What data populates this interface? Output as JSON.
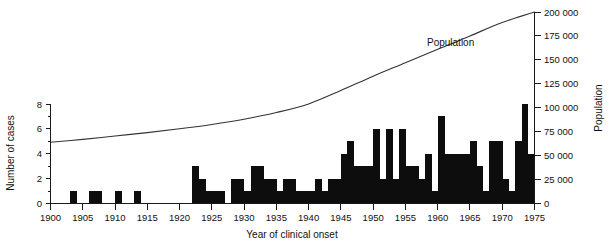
{
  "chart_data": {
    "type": "bar",
    "title": "",
    "xlabel": "Year of clinical onset",
    "ylabel": "Number of cases",
    "y2label": "Population",
    "xlim": [
      1900,
      1975
    ],
    "ylim": [
      0,
      8
    ],
    "y2lim": [
      0,
      200000
    ],
    "grid": false,
    "legend_position": "inline-annotation",
    "x_tick_labels": [
      "1900",
      "1905",
      "1910",
      "1915",
      "1920",
      "1925",
      "1930",
      "1935",
      "1940",
      "1945",
      "1950",
      "1955",
      "1960",
      "1965",
      "1970",
      "1975"
    ],
    "x_tick_values": [
      1900,
      1905,
      1910,
      1915,
      1920,
      1925,
      1930,
      1935,
      1940,
      1945,
      1950,
      1955,
      1960,
      1965,
      1970,
      1975
    ],
    "y_tick_labels": [
      "0",
      "2",
      "4",
      "6",
      "8"
    ],
    "y_tick_values": [
      0,
      2,
      4,
      6,
      8
    ],
    "y2_tick_labels": [
      "0",
      "25 000",
      "50 000",
      "75 000",
      "100 000",
      "125 000",
      "150 000",
      "175 000",
      "200 000"
    ],
    "y2_tick_values": [
      0,
      25000,
      50000,
      75000,
      100000,
      125000,
      150000,
      175000,
      200000
    ],
    "annotations": [
      {
        "text": "Population",
        "x": 1962,
        "y2": 165000
      }
    ],
    "series": [
      {
        "name": "Number of cases",
        "type": "bar",
        "categories": [
          1900,
          1901,
          1902,
          1903,
          1904,
          1905,
          1906,
          1907,
          1908,
          1909,
          1910,
          1911,
          1912,
          1913,
          1914,
          1915,
          1916,
          1917,
          1918,
          1919,
          1920,
          1921,
          1922,
          1923,
          1924,
          1925,
          1926,
          1927,
          1928,
          1929,
          1930,
          1931,
          1932,
          1933,
          1934,
          1935,
          1936,
          1937,
          1938,
          1939,
          1940,
          1941,
          1942,
          1943,
          1944,
          1945,
          1946,
          1947,
          1948,
          1949,
          1950,
          1951,
          1952,
          1953,
          1954,
          1955,
          1956,
          1957,
          1958,
          1959,
          1960,
          1961,
          1962,
          1963,
          1964,
          1965,
          1966,
          1967,
          1968,
          1969,
          1970,
          1971,
          1972,
          1973,
          1974
        ],
        "values": [
          0,
          0,
          0,
          1,
          0,
          0,
          1,
          1,
          0,
          0,
          1,
          0,
          0,
          1,
          0,
          0,
          0,
          0,
          0,
          0,
          0,
          0,
          3,
          2,
          1,
          1,
          1,
          0,
          2,
          2,
          1,
          3,
          3,
          2,
          2,
          1,
          2,
          2,
          1,
          1,
          1,
          2,
          1,
          2,
          2,
          4,
          5,
          3,
          3,
          3,
          6,
          2,
          6,
          2,
          6,
          3,
          3,
          2,
          4,
          1,
          7,
          4,
          4,
          4,
          4,
          5,
          3,
          1,
          5,
          5,
          2,
          1,
          5,
          8,
          4
        ]
      },
      {
        "name": "Population",
        "type": "line",
        "axis": "right",
        "x": [
          1900,
          1905,
          1910,
          1915,
          1920,
          1925,
          1930,
          1935,
          1940,
          1945,
          1950,
          1955,
          1960,
          1965,
          1970,
          1975
        ],
        "values": [
          64000,
          67000,
          70500,
          74000,
          78000,
          82500,
          88000,
          95000,
          104000,
          118000,
          133000,
          147000,
          161000,
          175000,
          189000,
          200000
        ]
      }
    ]
  },
  "axes": {
    "left_title": "Number of cases",
    "right_title": "Population",
    "bottom_title": "Year of clinical onset"
  }
}
